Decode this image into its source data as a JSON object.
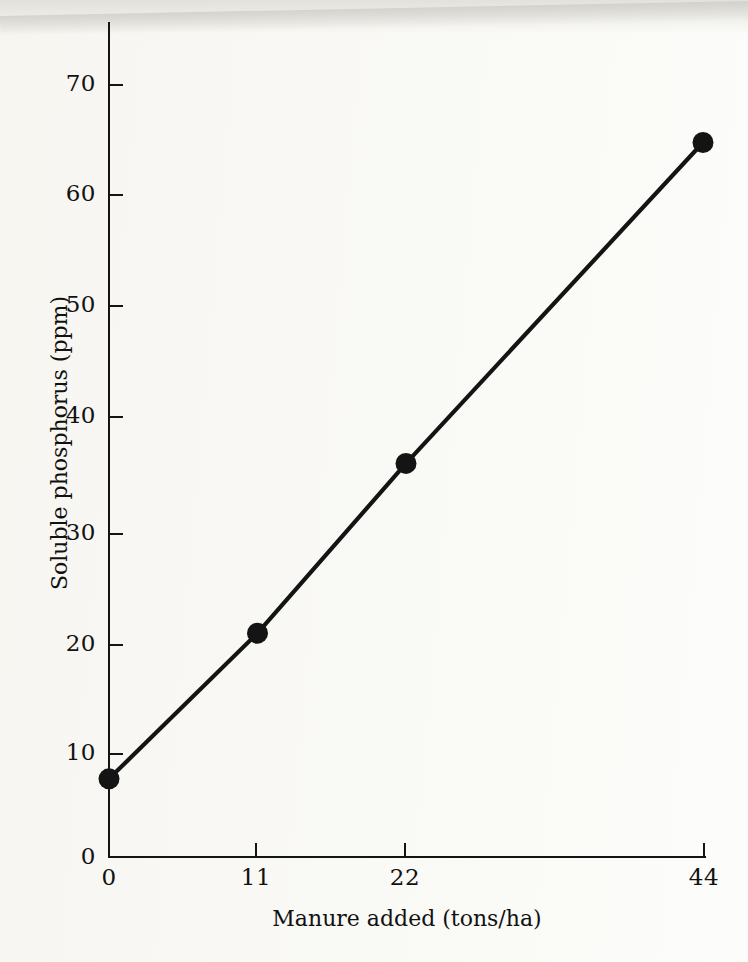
{
  "figure": {
    "background_color": "#fbfbf9",
    "ink_color": "#141414"
  },
  "chart_data": {
    "type": "line",
    "title": "",
    "subtitle": "",
    "xlabel": "Manure added (tons/ha)",
    "ylabel": "Soluble phosphorus (ppm)",
    "x": [
      0,
      11,
      22,
      44
    ],
    "values": [
      7,
      20.2,
      35.6,
      64.7
    ],
    "series": [
      {
        "name": "Soluble phosphorus",
        "x": [
          0,
          11,
          22,
          44
        ],
        "values": [
          7,
          20.2,
          35.6,
          64.7
        ],
        "marker": "filled-circle",
        "marker_color": "#141414",
        "line_color": "#141414"
      }
    ],
    "x_tick_labels": [
      "0",
      "11",
      "22",
      "44"
    ],
    "x_tick_values": [
      0,
      11,
      22,
      44
    ],
    "y_tick_labels": [
      "0",
      "10",
      "20",
      "30",
      "40",
      "50",
      "60",
      "70"
    ],
    "y_tick_values": [
      0,
      10,
      20,
      30,
      40,
      50,
      60,
      70
    ],
    "xlim": [
      0,
      44
    ],
    "ylim": [
      0,
      78
    ],
    "grid": false,
    "legend": "none",
    "annotations": []
  },
  "axes": {
    "y_title": "Soluble phosphorus (ppm)",
    "x_title": "Manure added (tons/ha)",
    "y_labels": [
      "70",
      "60",
      "50",
      "40",
      "30",
      "20",
      "10",
      "0"
    ],
    "x_labels": [
      "0",
      "11",
      "22",
      "44"
    ]
  }
}
